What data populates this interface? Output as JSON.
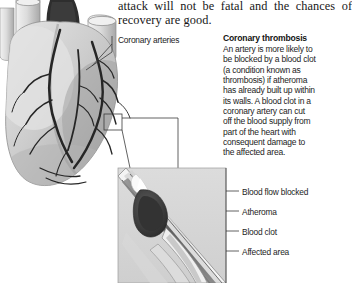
{
  "document": {
    "body_text": {
      "line1": "attack will not be fatal and the chances of",
      "line2": "recovery are good."
    }
  },
  "heart_diagram": {
    "callout_label": "Coronary arteries"
  },
  "thrombosis_section": {
    "heading": "Coronary thrombosis",
    "lines": [
      "An artery is more likely to",
      "be blocked by a blood clot",
      "(a condition known as",
      "thrombosis) if atheroma",
      "has already built up within",
      "its walls. A blood clot in a",
      "coronary artery can cut",
      "off the blood supply from",
      "part of the heart with",
      "consequent damage to",
      "the affected area."
    ]
  },
  "artery_cross_section": {
    "labels": [
      "Blood flow blocked",
      "Atheroma",
      "Blood clot",
      "Affected area"
    ]
  },
  "colors": {
    "page_background": "#ffffff",
    "text": "#1a1a1a",
    "leader_line": "#3a3a3a",
    "heart_fill": "#cfcfcf",
    "heart_shadow": "#9a9a9a",
    "vessel_light": "#e2e2e2",
    "artery_dark": "#2b2b2b",
    "clot_dark": "#3d3d3d",
    "atheroma_white": "#f6f6f6",
    "panel_gray": "#d6d6d6"
  }
}
